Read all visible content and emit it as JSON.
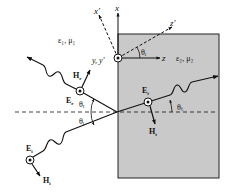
{
  "diagram": {
    "type": "oblique incidence at a dielectric interface (perpendicular polarization)",
    "colors": {
      "medium2_fill": "#c9c9c9",
      "line": "#111111",
      "background": "#ffffff"
    },
    "media": {
      "medium1": "ε₁, μ₁",
      "medium2": "ε₂, μ₂"
    },
    "axes": {
      "x": "x",
      "x_prime": "x′",
      "z": "z",
      "z_prime": "z′",
      "y": "y, y′"
    },
    "angles": {
      "origin_angle": "θᵢ",
      "reflected_angle": "θᵣ",
      "incident_angle": "θᵢ",
      "transmitted_angle": "θₜ"
    },
    "waves": {
      "incident": {
        "E": "E",
        "E_sub": "i",
        "H": "H",
        "H_sub": "i"
      },
      "reflected": {
        "E": "E",
        "E_sub": "r",
        "H": "H",
        "H_sub": "r"
      },
      "transmitted": {
        "E": "E",
        "E_sub": "t",
        "H": "H",
        "H_sub": "t"
      }
    }
  }
}
